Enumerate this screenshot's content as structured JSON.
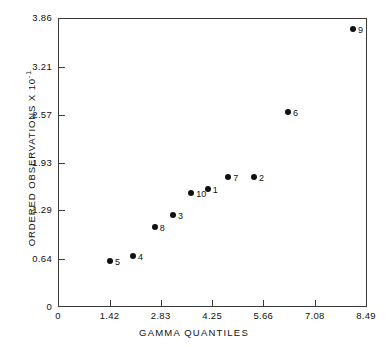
{
  "chart_data": {
    "type": "scatter",
    "title": "",
    "xlabel": "GAMMA QUANTILES",
    "ylabel": "ORDERED OBSERVATIONS X 10",
    "ylabel_exponent": "-1",
    "xlim": [
      0,
      8.49
    ],
    "ylim": [
      0,
      3.86
    ],
    "grid": false,
    "legend": "none",
    "xticks": [
      "0",
      "1.42",
      "2.83",
      "4.25",
      "5.66",
      "7.08",
      "8.49"
    ],
    "xtick_values": [
      0,
      1.42,
      2.83,
      4.25,
      5.66,
      7.08,
      8.49
    ],
    "yticks": [
      "0",
      "0.64",
      "1.29",
      "1.93",
      "2.57",
      "3.21",
      "3.86"
    ],
    "ytick_values": [
      0,
      0.64,
      1.29,
      1.93,
      2.57,
      3.21,
      3.86
    ],
    "points": [
      {
        "label": "5",
        "x": 1.43,
        "y": 0.62,
        "label_side": "right"
      },
      {
        "label": "4",
        "x": 2.07,
        "y": 0.68,
        "label_side": "right"
      },
      {
        "label": "8",
        "x": 2.67,
        "y": 1.07,
        "label_side": "right"
      },
      {
        "label": "3",
        "x": 3.17,
        "y": 1.23,
        "label_side": "right"
      },
      {
        "label": "10",
        "x": 3.67,
        "y": 1.52,
        "label_side": "right"
      },
      {
        "label": "1",
        "x": 4.13,
        "y": 1.57,
        "label_side": "right"
      },
      {
        "label": "7",
        "x": 4.69,
        "y": 1.73,
        "label_side": "right"
      },
      {
        "label": "2",
        "x": 5.4,
        "y": 1.73,
        "label_side": "right"
      },
      {
        "label": "6",
        "x": 6.34,
        "y": 2.6,
        "label_side": "right"
      },
      {
        "label": "9",
        "x": 8.13,
        "y": 3.71,
        "label_side": "right"
      }
    ]
  }
}
